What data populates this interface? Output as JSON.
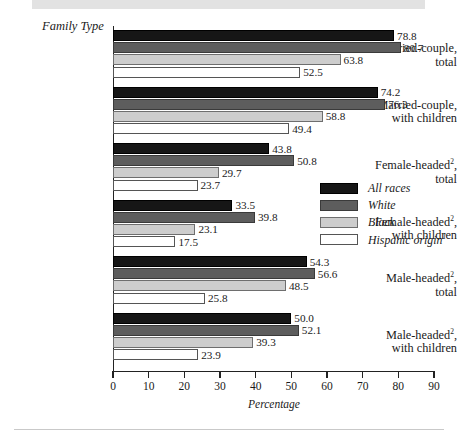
{
  "figure": {
    "family_type_label": "Family Type",
    "axis_title": "Percentage",
    "legend_title": ""
  },
  "chart_data": {
    "type": "bar",
    "orientation": "horizontal",
    "title": "",
    "xlabel": "Percentage",
    "ylabel": "Family Type",
    "xlim": [
      0,
      90
    ],
    "xticks": [
      0,
      10,
      20,
      30,
      40,
      50,
      60,
      70,
      80,
      90
    ],
    "grid": false,
    "legend_position": "middle-right",
    "categories": [
      "Married-couple, total",
      "Married-couple, with children",
      "Female-headed², total",
      "Female-headed², with children",
      "Male-headed², total",
      "Male-headed², with children"
    ],
    "category_lines": [
      [
        "Married-couple,",
        "total"
      ],
      [
        "Married-couple,",
        "with children"
      ],
      [
        "Female-headed2,",
        "total"
      ],
      [
        "Female-headed2,",
        "with children"
      ],
      [
        "Male-headed2,",
        "total"
      ],
      [
        "Male-headed2,",
        "with children"
      ]
    ],
    "series": [
      {
        "name": "All races",
        "color": "#161616",
        "values": [
          78.8,
          74.2,
          43.8,
          33.5,
          54.3,
          50.0
        ]
      },
      {
        "name": "White",
        "color": "#5d5d5d",
        "values": [
          80.7,
          76.3,
          50.8,
          39.8,
          56.6,
          52.1
        ]
      },
      {
        "name": "Black",
        "color": "#cdcdcd",
        "values": [
          63.8,
          58.8,
          29.7,
          23.1,
          48.5,
          39.3
        ]
      },
      {
        "name": "Hispanic origin1",
        "color": "#ffffff",
        "values": [
          52.5,
          49.4,
          23.7,
          17.5,
          25.8,
          23.9
        ]
      }
    ],
    "value_labels": [
      [
        "78.8",
        "80.7",
        "63.8",
        "52.5"
      ],
      [
        "74.2",
        "76.3",
        "58.8",
        "49.4"
      ],
      [
        "43.8",
        "50.8",
        "29.7",
        "23.7"
      ],
      [
        "33.5",
        "39.8",
        "23.1",
        "17.5"
      ],
      [
        "54.3",
        "56.6",
        "48.5",
        "25.8"
      ],
      [
        "50.0",
        "52.1",
        "39.3",
        "23.9"
      ]
    ]
  },
  "legend": {
    "items": [
      {
        "label": "All races",
        "sup": ""
      },
      {
        "label": "White",
        "sup": ""
      },
      {
        "label": "Black",
        "sup": ""
      },
      {
        "label": "Hispanic origin",
        "sup": "1"
      }
    ]
  }
}
